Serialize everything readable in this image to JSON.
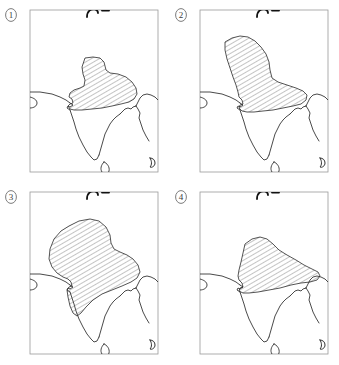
{
  "figure": {
    "type": "map-series",
    "panel_count": 4,
    "background_color": "#ffffff",
    "line_color": "#1a1a1a",
    "frame_color": "#8a8a8a",
    "hatch_color": "#555555",
    "label_color": "#3a3a3a"
  },
  "panels": [
    {
      "id": "panel-1",
      "label": "1",
      "label_style": "circled-number",
      "hatched_extent": "smallest",
      "hatched_region_note": "Compact hatched area over the Indo-Gangetic plain, roughly from the Indus to the Ganges delta"
    },
    {
      "id": "panel-2",
      "label": "2",
      "label_style": "circled-number",
      "hatched_extent": "medium-vertical",
      "hatched_region_note": "Boot-shaped hatched area extending north-west up the Indus valley and east along the Ganges"
    },
    {
      "id": "panel-3",
      "label": "3",
      "label_style": "circled-number",
      "hatched_extent": "largest",
      "hatched_region_note": "Broad hatched area covering most of northern and central India and reaching far to the north-west"
    },
    {
      "id": "panel-4",
      "label": "4",
      "label_style": "circled-number",
      "hatched_extent": "medium-horizontal",
      "hatched_region_note": "Elongated east-west hatched band across northern India reaching the eastern coast"
    }
  ],
  "map_features": [
    {
      "name": "subcontinent-coastline",
      "interactable": false
    },
    {
      "name": "sri-lanka-island",
      "interactable": false
    },
    {
      "name": "arabian-inlet",
      "interactable": false
    },
    {
      "name": "northern-dark-feature",
      "interactable": false
    },
    {
      "name": "southeast-corner-feature",
      "interactable": false
    }
  ],
  "legend": {
    "hatch_meaning": "hatched = highlighted region",
    "shown": false
  }
}
